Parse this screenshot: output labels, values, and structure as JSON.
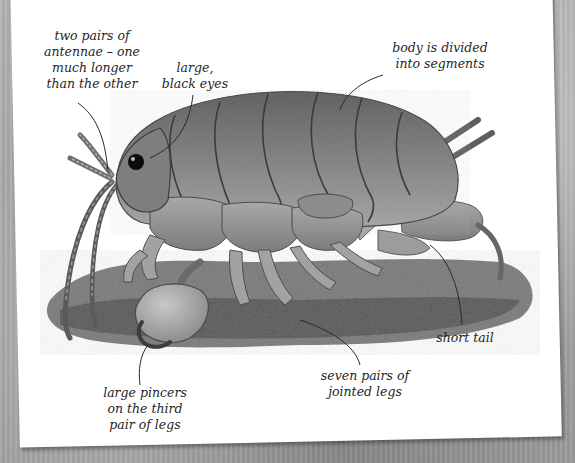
{
  "figure": {
    "labels": {
      "antennae": [
        "two pairs of",
        "antennae – one",
        "much longer",
        "than the other"
      ],
      "eyes": [
        "large,",
        "black eyes"
      ],
      "segments": [
        "body is divided",
        "into segments"
      ],
      "tail": [
        "short tail"
      ],
      "legs": [
        "seven pairs of",
        "jointed legs"
      ],
      "pincers": [
        "large pincers",
        "on the third",
        "pair of legs"
      ]
    },
    "colors": {
      "background": "#a9a9a9",
      "paper": "#ffffff",
      "ink": "#1f1f1f",
      "body_dark": "#4a4a4a",
      "body_light": "#9a9a9a",
      "sand": "#5a5a5a"
    }
  }
}
